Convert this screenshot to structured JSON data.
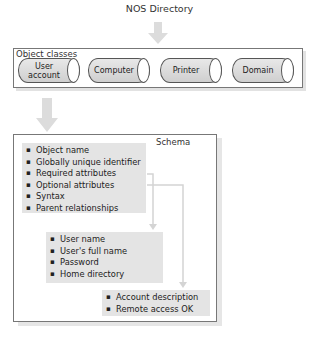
{
  "title": "NOS Directory",
  "object_classes": {
    "label": "Object classes",
    "items": [
      {
        "label": "User account"
      },
      {
        "label": "Computer"
      },
      {
        "label": "Printer"
      },
      {
        "label": "Domain"
      }
    ]
  },
  "schema": {
    "label": "Schema",
    "attributes": [
      "Object name",
      "Globally unique identifier",
      "Required attributes",
      "Optional attributes",
      "Syntax",
      "Parent relationships"
    ],
    "required_attributes": [
      "User name",
      "User's full name",
      "Password",
      "Home directory"
    ],
    "optional_attributes": [
      "Account description",
      "Remote access OK"
    ]
  },
  "colors": {
    "arrow": "#d9d9d9",
    "block_fill": "#e4e4e4",
    "border": "#777777"
  }
}
